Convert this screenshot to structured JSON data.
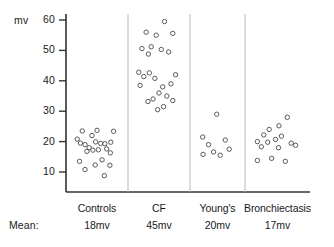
{
  "chart_data": {
    "type": "scatter",
    "title": "",
    "xlabel": "",
    "ylabel": "mv",
    "unit_label": "mv",
    "mean_caption": "Mean:",
    "ylim": [
      5,
      63
    ],
    "yticks": [
      10,
      20,
      30,
      40,
      50,
      60
    ],
    "ytick_labels": [
      "10",
      "20",
      "30",
      "40",
      "50",
      "60"
    ],
    "grid": false,
    "legend": "none",
    "axis_color": "#333333",
    "separator_color": "#b8b8b8",
    "marker_color": "#5a5a5a",
    "marker_shape": "open-circle",
    "categories": [
      "Controls",
      "CF",
      "Young's",
      "Bronchiectasis"
    ],
    "series": [
      {
        "name": "Controls",
        "label": "Controls",
        "mean": "18mv",
        "mean_value": 18,
        "n": 22,
        "points": [
          {
            "x": 0.18,
            "y": 23.5
          },
          {
            "x": 0.07,
            "y": 20.8
          },
          {
            "x": 0.39,
            "y": 22.0
          },
          {
            "x": 0.5,
            "y": 23.7
          },
          {
            "x": 0.86,
            "y": 23.4
          },
          {
            "x": 0.14,
            "y": 19.5
          },
          {
            "x": 0.24,
            "y": 19.0
          },
          {
            "x": 0.33,
            "y": 18.0
          },
          {
            "x": 0.47,
            "y": 19.9
          },
          {
            "x": 0.58,
            "y": 19.4
          },
          {
            "x": 0.67,
            "y": 19.3
          },
          {
            "x": 0.8,
            "y": 19.8
          },
          {
            "x": 0.28,
            "y": 16.8
          },
          {
            "x": 0.41,
            "y": 17.2
          },
          {
            "x": 0.53,
            "y": 17.3
          },
          {
            "x": 0.71,
            "y": 17.6
          },
          {
            "x": 0.79,
            "y": 16.3
          },
          {
            "x": 0.12,
            "y": 13.5
          },
          {
            "x": 0.24,
            "y": 10.8
          },
          {
            "x": 0.46,
            "y": 12.3
          },
          {
            "x": 0.61,
            "y": 14.0
          },
          {
            "x": 0.78,
            "y": 12.2
          },
          {
            "x": 0.66,
            "y": 8.8
          }
        ]
      },
      {
        "name": "CF",
        "label": "CF",
        "mean": "45mv",
        "mean_value": 45,
        "n": 24,
        "points": [
          {
            "x": 0.62,
            "y": 59.5
          },
          {
            "x": 0.22,
            "y": 56.0
          },
          {
            "x": 0.44,
            "y": 55.0
          },
          {
            "x": 0.8,
            "y": 55.6
          },
          {
            "x": 0.13,
            "y": 50.6
          },
          {
            "x": 0.33,
            "y": 51.2
          },
          {
            "x": 0.27,
            "y": 48.8
          },
          {
            "x": 0.55,
            "y": 50.3
          },
          {
            "x": 0.71,
            "y": 49.5
          },
          {
            "x": 0.06,
            "y": 42.8
          },
          {
            "x": 0.17,
            "y": 41.4
          },
          {
            "x": 0.29,
            "y": 42.6
          },
          {
            "x": 0.41,
            "y": 40.8
          },
          {
            "x": 0.09,
            "y": 38.5
          },
          {
            "x": 0.58,
            "y": 38.0
          },
          {
            "x": 0.86,
            "y": 42.0
          },
          {
            "x": 0.76,
            "y": 39.0
          },
          {
            "x": 0.5,
            "y": 36.0
          },
          {
            "x": 0.67,
            "y": 35.0
          },
          {
            "x": 0.37,
            "y": 34.0
          },
          {
            "x": 0.26,
            "y": 33.2
          },
          {
            "x": 0.6,
            "y": 31.5
          },
          {
            "x": 0.47,
            "y": 30.5
          },
          {
            "x": 0.8,
            "y": 33.5
          }
        ]
      },
      {
        "name": "Young's",
        "label": "Young's",
        "mean": "20mv",
        "mean_value": 20,
        "n": 8,
        "points": [
          {
            "x": 0.48,
            "y": 29.0
          },
          {
            "x": 0.12,
            "y": 21.5
          },
          {
            "x": 0.27,
            "y": 19.0
          },
          {
            "x": 0.7,
            "y": 20.5
          },
          {
            "x": 0.8,
            "y": 17.5
          },
          {
            "x": 0.4,
            "y": 16.6
          },
          {
            "x": 0.13,
            "y": 15.8
          },
          {
            "x": 0.57,
            "y": 15.5
          }
        ]
      },
      {
        "name": "Bronchiectasis",
        "label": "Bronchiectasis",
        "mean": "17mv",
        "mean_value": 17,
        "n": 15,
        "points": [
          {
            "x": 0.7,
            "y": 28.0
          },
          {
            "x": 0.53,
            "y": 25.2
          },
          {
            "x": 0.33,
            "y": 24.0
          },
          {
            "x": 0.22,
            "y": 22.2
          },
          {
            "x": 0.58,
            "y": 21.8
          },
          {
            "x": 0.46,
            "y": 20.7
          },
          {
            "x": 0.09,
            "y": 20.0
          },
          {
            "x": 0.3,
            "y": 19.8
          },
          {
            "x": 0.78,
            "y": 19.5
          },
          {
            "x": 0.17,
            "y": 18.3
          },
          {
            "x": 0.52,
            "y": 18.0
          },
          {
            "x": 0.87,
            "y": 18.8
          },
          {
            "x": 0.38,
            "y": 14.5
          },
          {
            "x": 0.09,
            "y": 13.8
          },
          {
            "x": 0.66,
            "y": 13.5
          }
        ]
      }
    ]
  }
}
